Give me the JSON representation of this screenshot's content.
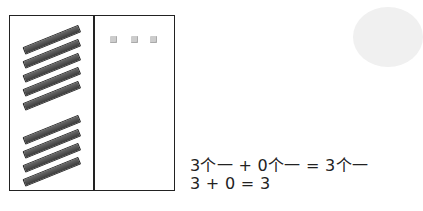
{
  "place_value_chart": {
    "columns": [
      "tens",
      "ones"
    ],
    "tens_rods": {
      "top_group": 5,
      "bottom_group": 4
    },
    "ones_cubes": 3
  },
  "equations": {
    "line1": "3个一 + 0个一 = 3个一",
    "line2": "3 + 0 = 3"
  }
}
